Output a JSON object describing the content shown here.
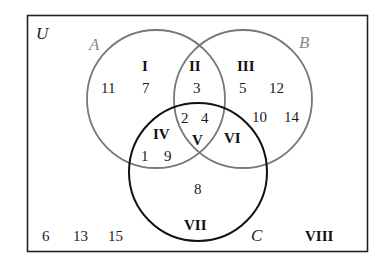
{
  "diagram": {
    "type": "venn-three-set",
    "universe_label": "U",
    "sets": [
      {
        "label": "A",
        "color": "#777777"
      },
      {
        "label": "B",
        "color": "#777777"
      },
      {
        "label": "C",
        "color": "#111111"
      }
    ],
    "regions": [
      {
        "id": "I",
        "label": "I",
        "elements": [
          "11",
          "7"
        ]
      },
      {
        "id": "II",
        "label": "II",
        "elements": [
          "3"
        ]
      },
      {
        "id": "III",
        "label": "III",
        "elements": [
          "5",
          "12",
          "10",
          "14"
        ]
      },
      {
        "id": "IV",
        "label": "IV",
        "elements": [
          "1",
          "9"
        ]
      },
      {
        "id": "V",
        "label": "V",
        "elements": [
          "2",
          "4"
        ]
      },
      {
        "id": "VI",
        "label": "VI",
        "elements": []
      },
      {
        "id": "VII",
        "label": "VII",
        "elements": [
          "8"
        ]
      },
      {
        "id": "VIII",
        "label": "VIII",
        "elements": [
          "6",
          "13",
          "15"
        ]
      }
    ],
    "colors": {
      "frame": "#222222",
      "circle_ab": "#777777",
      "circle_c": "#111111",
      "text": "#1a1a1a"
    }
  }
}
